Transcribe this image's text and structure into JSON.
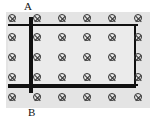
{
  "diagram": {
    "type": "physics-magnetic-field-rails",
    "field_symbol": "into-page (⊗)",
    "labels": {
      "top": "A",
      "bottom": "B"
    },
    "grid": {
      "cols": [
        12,
        37,
        62,
        87,
        112,
        138
      ],
      "rows": [
        18,
        37,
        57,
        77,
        97
      ]
    },
    "colors": {
      "line": "#111111",
      "field_bg": "#e4e4e4",
      "inner_bg": "#ebebeb"
    }
  }
}
